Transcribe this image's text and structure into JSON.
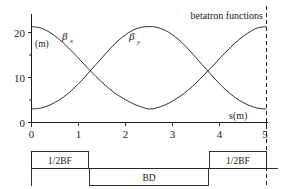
{
  "figure": {
    "annotation": "betatron functions",
    "y_axis": {
      "unit_label": "(m)",
      "ticks": [
        0,
        10,
        20
      ],
      "tick_labels": [
        "0",
        "10",
        "20"
      ],
      "minor_ticks": [
        5,
        15
      ],
      "range": [
        0,
        24
      ]
    },
    "x_axis": {
      "name": "s(m)",
      "ticks": [
        0,
        1,
        2,
        3,
        4,
        5
      ],
      "tick_labels": [
        "0",
        "1",
        "2",
        "3",
        "4",
        "5"
      ],
      "range": [
        0,
        5.1
      ]
    },
    "curves": [
      {
        "label": "β",
        "subscript": "x",
        "label_x": 1.05,
        "label_y": 18.6
      },
      {
        "label": "β",
        "subscript": "y",
        "label_x": 2.55,
        "label_y": 18.6
      }
    ],
    "period_marker": {
      "position": 5.1,
      "style": "dashed"
    }
  },
  "lattice": {
    "elements": [
      {
        "name": "1/2BF",
        "start": 0.0,
        "end": 1.23,
        "side": "up"
      },
      {
        "name": "BD",
        "start": 1.27,
        "end": 3.83,
        "side": "down"
      },
      {
        "name": "1/2BF",
        "start": 3.87,
        "end": 5.1,
        "side": "up"
      }
    ]
  },
  "chart_data": {
    "type": "line",
    "title": "betatron functions",
    "xlabel": "s(m)",
    "ylabel": "(m)",
    "xlim": [
      0,
      5.1
    ],
    "ylim": [
      0,
      24
    ],
    "grid": false,
    "legend": "inline-labels",
    "x": [
      0.0,
      0.2,
      0.4,
      0.6,
      0.8,
      1.0,
      1.2,
      1.4,
      1.6,
      1.8,
      2.0,
      2.2,
      2.4,
      2.55,
      2.7,
      2.9,
      3.1,
      3.3,
      3.5,
      3.7,
      3.9,
      4.1,
      4.3,
      4.5,
      4.7,
      4.9,
      5.1
    ],
    "series": [
      {
        "name": "βx",
        "values": [
          21.3,
          21.0,
          20.0,
          18.5,
          16.6,
          14.5,
          12.3,
          10.2,
          8.3,
          6.6,
          5.3,
          4.2,
          3.4,
          3.0,
          3.2,
          3.9,
          5.0,
          6.4,
          8.1,
          10.1,
          12.2,
          14.4,
          16.5,
          18.4,
          19.9,
          21.0,
          21.3
        ]
      },
      {
        "name": "βy",
        "values": [
          3.0,
          3.2,
          3.9,
          5.0,
          6.5,
          8.4,
          10.6,
          12.9,
          15.2,
          17.4,
          19.2,
          20.5,
          21.2,
          21.3,
          21.2,
          20.5,
          19.2,
          17.4,
          15.2,
          12.9,
          10.6,
          8.4,
          6.5,
          5.0,
          3.9,
          3.2,
          3.0
        ]
      }
    ],
    "crossings": [
      {
        "s": 1.27,
        "beta": 9.8
      },
      {
        "s": 3.83,
        "beta": 9.8
      }
    ]
  }
}
